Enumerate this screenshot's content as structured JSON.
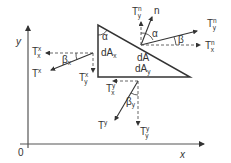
{
  "diagram": {
    "type": "traction-vectors-on-triangular-element",
    "axes": {
      "x_label": "x",
      "y_label": "y",
      "origin_label": "0"
    },
    "element": {
      "angle_label": "α",
      "area_labels": {
        "dAx_main": "dA",
        "dAx_sub": "x",
        "dA": "dA",
        "dAy_main": "dA",
        "dAy_sub": "y"
      }
    },
    "normal_face": {
      "normal_label": "n",
      "alpha_label": "α",
      "beta_label": "β",
      "T_top": {
        "main": "T",
        "sup": "n",
        "sub": "y"
      },
      "T_right": {
        "main": "T",
        "sup": "n",
        "sub": "y"
      },
      "T_x": {
        "main": "T",
        "sup": "n",
        "sub": "x"
      }
    },
    "x_face": {
      "beta_label": "β",
      "beta_sub": "x",
      "Tx_x": {
        "main": "T",
        "sup": "x",
        "sub": "x"
      },
      "T": {
        "main": "T",
        "sup": "x"
      },
      "Tx_y": {
        "main": "T",
        "sup": "x",
        "sub": "y"
      }
    },
    "y_face": {
      "beta_label": "β",
      "beta_sub": "y",
      "Ty_x": {
        "main": "T",
        "sup": "y",
        "sub": "x"
      },
      "T": {
        "main": "T",
        "sup": "y"
      },
      "Ty_y": {
        "main": "T",
        "sup": "y",
        "sub": "y"
      }
    },
    "colors": {
      "stroke": "#333333",
      "dashed": "#555555"
    }
  }
}
